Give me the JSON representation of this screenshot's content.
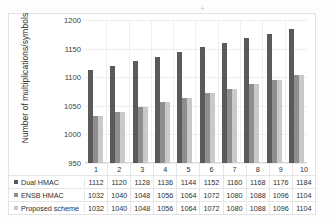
{
  "chart_data": {
    "type": "bar",
    "title": "",
    "xlabel": "",
    "ylabel": "Number of multiplications/symbols",
    "categories": [
      "1",
      "2",
      "3",
      "4",
      "5",
      "6",
      "7",
      "8",
      "9",
      "10"
    ],
    "ylim": [
      950,
      1200
    ],
    "yticks": [
      950,
      1000,
      1050,
      1100,
      1150,
      1200
    ],
    "grid": true,
    "legend_position": "data-table-left",
    "series": [
      {
        "name": "Dual HMAC",
        "color": "#5a5a5a",
        "values": [
          1112,
          1120,
          1128,
          1136,
          1144,
          1152,
          1160,
          1168,
          1176,
          1184
        ]
      },
      {
        "name": "ENSB HMAC",
        "color": "#8e8e8e",
        "values": [
          1032,
          1040,
          1048,
          1056,
          1064,
          1072,
          1080,
          1088,
          1096,
          1104
        ]
      },
      {
        "name": "Proposed scheme",
        "color": "#c9c9c9",
        "values": [
          1032,
          1040,
          1048,
          1056,
          1064,
          1072,
          1080,
          1088,
          1096,
          1104
        ]
      }
    ]
  },
  "artifact": {
    "mark": "+"
  }
}
